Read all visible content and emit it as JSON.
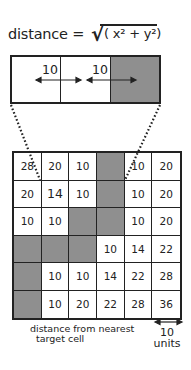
{
  "equation": {
    "lhs": "distance =",
    "radical": "√",
    "radicand": "( x² + y²)"
  },
  "strip": {
    "cells": [
      "empty",
      "empty",
      "target"
    ],
    "labels": [
      "10",
      "10"
    ]
  },
  "grid": {
    "rows": [
      [
        "28",
        "20",
        "10",
        "",
        "10",
        "20"
      ],
      [
        "20",
        "14",
        "10",
        "",
        "10",
        "20"
      ],
      [
        "10",
        "10",
        "",
        "",
        "10",
        "20"
      ],
      [
        "",
        "",
        "",
        "10",
        "14",
        "22"
      ],
      [
        "",
        "10",
        "10",
        "14",
        "22",
        "28"
      ],
      [
        "",
        "10",
        "20",
        "22",
        "28",
        "36"
      ]
    ],
    "target_cells": [
      [
        0,
        3
      ],
      [
        1,
        3
      ],
      [
        2,
        2
      ],
      [
        2,
        3
      ],
      [
        3,
        0
      ],
      [
        3,
        1
      ],
      [
        3,
        2
      ],
      [
        4,
        0
      ],
      [
        5,
        0
      ]
    ]
  },
  "caption": {
    "line1": "distance from nearest",
    "line2": "target cell"
  },
  "scale": {
    "value": "10",
    "unit": "units"
  },
  "colors": {
    "target": "#8f8f8f",
    "line": "#222222",
    "background": "#ffffff"
  }
}
